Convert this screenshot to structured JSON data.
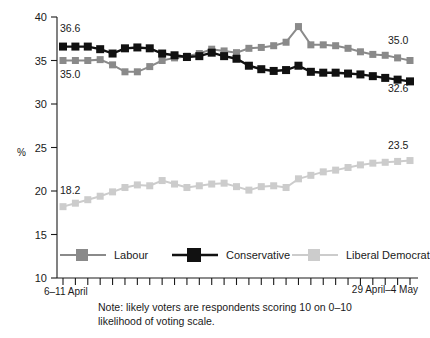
{
  "chart_data": {
    "type": "line",
    "title": "",
    "subtitle": "",
    "xlabel": "",
    "ylabel": "%",
    "ylim": [
      10,
      40
    ],
    "yticks": [
      10,
      15,
      20,
      25,
      30,
      35,
      40
    ],
    "ytick_labels": [
      "10",
      "15",
      "20",
      "25",
      "30",
      "35",
      "40"
    ],
    "grid": false,
    "legend_position": "bottom",
    "x_axis_start_label": "6–11 April",
    "x_axis_end_label": "29 April–4 May",
    "n_points": 29,
    "categories": [
      "1",
      "2",
      "3",
      "4",
      "5",
      "6",
      "7",
      "8",
      "9",
      "10",
      "11",
      "12",
      "13",
      "14",
      "15",
      "16",
      "17",
      "18",
      "19",
      "20",
      "21",
      "22",
      "23",
      "24",
      "25",
      "26",
      "27",
      "28",
      "29"
    ],
    "series": [
      {
        "name": "Labour",
        "color": "#8a8a8a",
        "values": [
          35.0,
          35.0,
          35.0,
          35.1,
          34.5,
          33.7,
          33.7,
          34.3,
          35.0,
          35.3,
          35.5,
          35.8,
          36.3,
          36.1,
          35.9,
          36.4,
          36.5,
          36.7,
          37.1,
          38.9,
          36.8,
          36.8,
          36.7,
          36.4,
          36.0,
          35.7,
          35.6,
          35.3,
          35.0
        ],
        "start_label": "35.0",
        "end_label": "35.0"
      },
      {
        "name": "Conservative",
        "color": "#111111",
        "values": [
          36.6,
          36.6,
          36.6,
          36.3,
          35.8,
          36.4,
          36.5,
          36.4,
          35.8,
          35.6,
          35.4,
          35.5,
          35.9,
          35.5,
          35.2,
          34.4,
          34.0,
          33.8,
          33.9,
          34.4,
          33.7,
          33.6,
          33.6,
          33.5,
          33.4,
          33.2,
          33.0,
          32.8,
          32.6
        ],
        "start_label": "36.6",
        "end_label": "32.6"
      },
      {
        "name": "Liberal Democrat",
        "color": "#cccccc",
        "values": [
          18.2,
          18.6,
          19.0,
          19.4,
          19.9,
          20.4,
          20.7,
          20.6,
          21.2,
          20.8,
          20.4,
          20.6,
          20.8,
          20.9,
          20.5,
          20.1,
          20.5,
          20.6,
          20.4,
          21.4,
          21.8,
          22.2,
          22.4,
          22.7,
          23.0,
          23.2,
          23.3,
          23.4,
          23.5
        ],
        "start_label": "18.2",
        "end_label": "23.5"
      }
    ],
    "annotations": [
      {
        "name": "conservative-start",
        "text": "36.6"
      },
      {
        "name": "labour-start",
        "text": "35.0"
      },
      {
        "name": "libdem-start",
        "text": "18.2"
      },
      {
        "name": "labour-end",
        "text": "35.0"
      },
      {
        "name": "conservative-end",
        "text": "32.6"
      },
      {
        "name": "libdem-end",
        "text": "23.5"
      }
    ]
  },
  "legend": {
    "items": [
      {
        "label": "Labour",
        "color": "#8a8a8a"
      },
      {
        "label": "Conservative",
        "color": "#111111"
      },
      {
        "label": "Liberal Democrat",
        "color": "#cccccc"
      }
    ]
  },
  "note": {
    "line1": "Note: likely voters are respondents scoring 10 on 0–10",
    "line2": "likelihood of voting scale."
  }
}
